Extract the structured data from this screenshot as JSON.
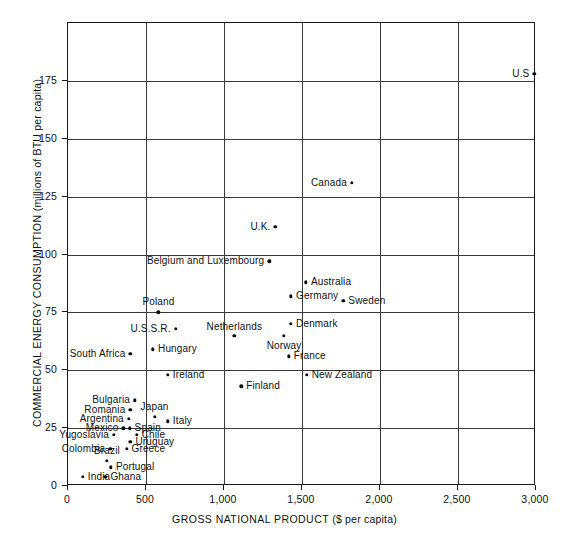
{
  "chart_data": {
    "type": "scatter",
    "title": "",
    "xlabel": "GROSS NATIONAL PRODUCT ($ per capita)",
    "ylabel": "COMMERCIAL ENERGY CONSUMPTION (millions of BTU per capita)",
    "xlabel_main": "GROSS NATIONAL PRODUCT",
    "xlabel_unit": "($ per capita)",
    "ylabel_main": "COMMERCIAL ENERGY CONSUMPTION",
    "ylabel_unit": "(millions of BTU per capita)",
    "xlim": [
      0,
      3000
    ],
    "ylim": [
      0,
      200
    ],
    "xticks": [
      0,
      500,
      1000,
      1500,
      2000,
      2500,
      3000
    ],
    "xticklabels": [
      "0",
      "500",
      "1,000",
      "1,500",
      "2,000",
      "2,500",
      "3,000"
    ],
    "yticks": [
      0,
      25,
      50,
      75,
      100,
      125,
      150,
      175
    ],
    "yticklabels": [
      "0",
      "25",
      "50",
      "75",
      "100",
      "125",
      "150",
      "175"
    ],
    "grid": true,
    "grid_axis": "both",
    "legend": "none",
    "marker_color": "#0c0c0c",
    "grid_color": "#3a3a3a",
    "frame_color": "#1a1a1a",
    "points": [
      {
        "label": "U.S",
        "x": 2990,
        "y": 178,
        "label_pos": "left"
      },
      {
        "label": "Canada",
        "x": 1820,
        "y": 131,
        "label_pos": "left"
      },
      {
        "label": "U.K.",
        "x": 1330,
        "y": 112,
        "label_pos": "left"
      },
      {
        "label": "Belgium and Luxembourg",
        "x": 1290,
        "y": 97,
        "label_pos": "left"
      },
      {
        "label": "Australia",
        "x": 1525,
        "y": 88,
        "label_pos": "right"
      },
      {
        "label": "Germany",
        "x": 1430,
        "y": 82,
        "label_pos": "right"
      },
      {
        "label": "Sweden",
        "x": 1765,
        "y": 80,
        "label_pos": "right"
      },
      {
        "label": "Poland",
        "x": 580,
        "y": 75,
        "label_pos": "above"
      },
      {
        "label": "Denmark",
        "x": 1430,
        "y": 70,
        "label_pos": "right"
      },
      {
        "label": "U.S.S.R.",
        "x": 690,
        "y": 68,
        "label_pos": "left"
      },
      {
        "label": "Netherlands",
        "x": 1065,
        "y": 65,
        "label_pos": "above-left"
      },
      {
        "label": "Norway",
        "x": 1385,
        "y": 65,
        "label_pos": "below"
      },
      {
        "label": "Hungary",
        "x": 545,
        "y": 59,
        "label_pos": "right"
      },
      {
        "label": "South Africa",
        "x": 400,
        "y": 57,
        "label_pos": "left"
      },
      {
        "label": "France",
        "x": 1415,
        "y": 56,
        "label_pos": "right"
      },
      {
        "label": "Ireland",
        "x": 640,
        "y": 48,
        "label_pos": "right"
      },
      {
        "label": "New Zealand",
        "x": 1530,
        "y": 48,
        "label_pos": "right"
      },
      {
        "label": "Finland",
        "x": 1110,
        "y": 43,
        "label_pos": "right"
      },
      {
        "label": "Bulgaria",
        "x": 430,
        "y": 37,
        "label_pos": "left"
      },
      {
        "label": "Romania",
        "x": 400,
        "y": 33,
        "label_pos": "left"
      },
      {
        "label": "Japan",
        "x": 555,
        "y": 30,
        "label_pos": "above"
      },
      {
        "label": "Argentina",
        "x": 390,
        "y": 29,
        "label_pos": "left"
      },
      {
        "label": "Italy",
        "x": 640,
        "y": 28,
        "label_pos": "right"
      },
      {
        "label": "Mexico",
        "x": 355,
        "y": 25,
        "label_pos": "left"
      },
      {
        "label": "Spain",
        "x": 395,
        "y": 25,
        "label_pos": "right"
      },
      {
        "label": "Chile",
        "x": 440,
        "y": 22,
        "label_pos": "right"
      },
      {
        "label": "Yugoslavia",
        "x": 295,
        "y": 22,
        "label_pos": "left"
      },
      {
        "label": "Uruguay",
        "x": 400,
        "y": 19,
        "label_pos": "right"
      },
      {
        "label": "Colombia",
        "x": 270,
        "y": 16,
        "label_pos": "left"
      },
      {
        "label": "Greece",
        "x": 375,
        "y": 16,
        "label_pos": "right"
      },
      {
        "label": "Brazil",
        "x": 250,
        "y": 11,
        "label_pos": "above"
      },
      {
        "label": "Portugal",
        "x": 275,
        "y": 8,
        "label_pos": "right"
      },
      {
        "label": "India",
        "x": 95,
        "y": 4,
        "label_pos": "right"
      },
      {
        "label": "Ghana",
        "x": 240,
        "y": 4,
        "label_pos": "right"
      }
    ]
  }
}
